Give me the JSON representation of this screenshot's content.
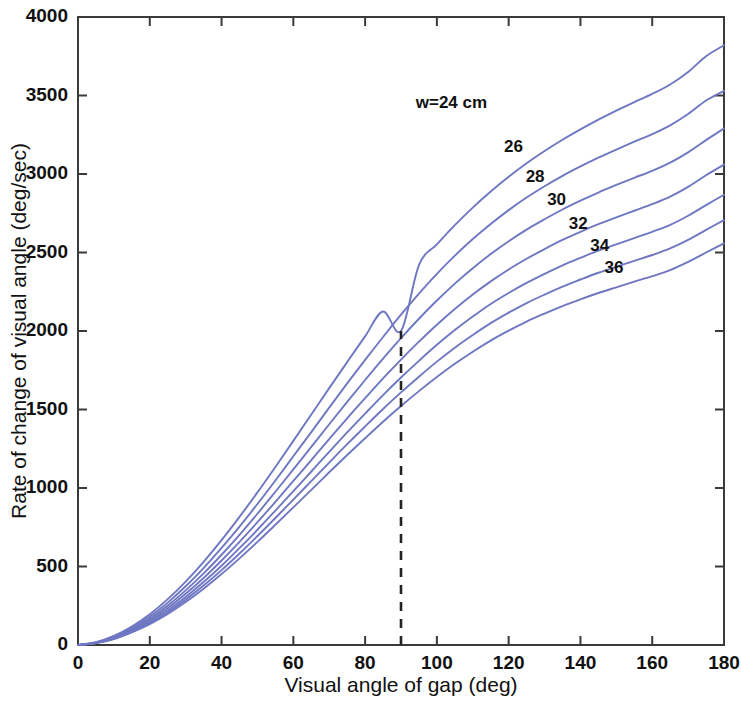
{
  "chart_data": {
    "type": "line",
    "title": "",
    "xlabel": "Visual angle of gap (deg)",
    "ylabel": "Rate of change of visual angle (deg/sec)",
    "xlim": [
      0,
      180
    ],
    "ylim": [
      0,
      4000
    ],
    "xticks": [
      0,
      20,
      40,
      60,
      80,
      100,
      120,
      140,
      160,
      180
    ],
    "yticks": [
      0,
      500,
      1000,
      1500,
      2000,
      2500,
      3000,
      3500,
      4000
    ],
    "grid": false,
    "legend_position": "inline-curve-labels",
    "series_color": "#6f77c2",
    "annotations": [
      {
        "name": "reference-line",
        "type": "vertical-dashed-line",
        "x": 90,
        "y_from": 0,
        "y_to": 2000,
        "color": "#232323"
      }
    ],
    "series": [
      {
        "name": "w=24 cm",
        "label": "w=24 cm",
        "w": 24,
        "x": [
          0,
          5,
          10,
          15,
          20,
          25,
          30,
          35,
          40,
          45,
          50,
          55,
          60,
          65,
          70,
          75,
          80,
          85,
          90,
          95,
          100,
          105,
          110,
          115,
          120,
          125,
          130,
          135,
          140,
          145,
          150,
          155,
          160,
          165,
          170,
          175,
          180
        ],
        "values": [
          0,
          18,
          58,
          118,
          196,
          292,
          404,
          530,
          668,
          816,
          972,
          1134,
          1300,
          1468,
          1636,
          1802,
          1966,
          2124,
          2000,
          2420,
          2552,
          2674,
          2786,
          2888,
          2982,
          3068,
          3146,
          3218,
          3284,
          3346,
          3404,
          3458,
          3510,
          3570,
          3650,
          3750,
          3820
        ]
      },
      {
        "name": "26",
        "label": "26",
        "w": 26,
        "x": [
          0,
          5,
          10,
          15,
          20,
          25,
          30,
          35,
          40,
          45,
          50,
          55,
          60,
          65,
          70,
          75,
          80,
          85,
          90,
          95,
          100,
          105,
          110,
          115,
          120,
          125,
          130,
          135,
          140,
          145,
          150,
          155,
          160,
          165,
          170,
          175,
          180
        ],
        "values": [
          0,
          16,
          53,
          109,
          181,
          270,
          374,
          490,
          618,
          754,
          898,
          1048,
          1202,
          1356,
          1512,
          1666,
          1816,
          1962,
          2104,
          2238,
          2364,
          2480,
          2586,
          2682,
          2770,
          2850,
          2922,
          2988,
          3048,
          3104,
          3156,
          3206,
          3254,
          3310,
          3382,
          3468,
          3530
        ]
      },
      {
        "name": "28",
        "label": "28",
        "w": 28,
        "x": [
          0,
          5,
          10,
          15,
          20,
          25,
          30,
          35,
          40,
          45,
          50,
          55,
          60,
          65,
          70,
          75,
          80,
          85,
          90,
          95,
          100,
          105,
          110,
          115,
          120,
          125,
          130,
          135,
          140,
          145,
          150,
          155,
          160,
          165,
          170,
          175,
          180
        ],
        "values": [
          0,
          15,
          49,
          101,
          168,
          251,
          348,
          456,
          575,
          702,
          836,
          976,
          1118,
          1262,
          1406,
          1548,
          1688,
          1824,
          1954,
          2078,
          2194,
          2302,
          2400,
          2490,
          2572,
          2646,
          2712,
          2774,
          2830,
          2882,
          2930,
          2976,
          3020,
          3072,
          3138,
          3216,
          3290
        ]
      },
      {
        "name": "30",
        "label": "30",
        "w": 30,
        "x": [
          0,
          5,
          10,
          15,
          20,
          25,
          30,
          35,
          40,
          45,
          50,
          55,
          60,
          65,
          70,
          75,
          80,
          85,
          90,
          95,
          100,
          105,
          110,
          115,
          120,
          125,
          130,
          135,
          140,
          145,
          150,
          155,
          160,
          165,
          170,
          175,
          180
        ],
        "values": [
          0,
          14,
          46,
          95,
          157,
          235,
          326,
          427,
          538,
          657,
          782,
          912,
          1045,
          1178,
          1312,
          1444,
          1572,
          1698,
          1818,
          1932,
          2040,
          2140,
          2232,
          2316,
          2392,
          2460,
          2522,
          2580,
          2632,
          2680,
          2724,
          2766,
          2808,
          2856,
          2918,
          2992,
          3060
        ]
      },
      {
        "name": "32",
        "label": "32",
        "w": 32,
        "x": [
          0,
          5,
          10,
          15,
          20,
          25,
          30,
          35,
          40,
          45,
          50,
          55,
          60,
          65,
          70,
          75,
          80,
          85,
          90,
          95,
          100,
          105,
          110,
          115,
          120,
          125,
          130,
          135,
          140,
          145,
          150,
          155,
          160,
          165,
          170,
          175,
          180
        ],
        "values": [
          0,
          13,
          43,
          89,
          148,
          221,
          306,
          401,
          505,
          617,
          734,
          856,
          980,
          1105,
          1230,
          1354,
          1474,
          1592,
          1704,
          1810,
          1912,
          2006,
          2092,
          2172,
          2242,
          2306,
          2364,
          2418,
          2466,
          2512,
          2552,
          2592,
          2632,
          2676,
          2734,
          2802,
          2868
        ]
      },
      {
        "name": "34",
        "label": "34",
        "w": 34,
        "x": [
          0,
          5,
          10,
          15,
          20,
          25,
          30,
          35,
          40,
          45,
          50,
          55,
          60,
          65,
          70,
          75,
          80,
          85,
          90,
          95,
          100,
          105,
          110,
          115,
          120,
          125,
          130,
          135,
          140,
          145,
          150,
          155,
          160,
          165,
          170,
          175,
          180
        ],
        "values": [
          0,
          12,
          40,
          84,
          140,
          209,
          289,
          379,
          477,
          583,
          694,
          809,
          926,
          1044,
          1162,
          1279,
          1392,
          1503,
          1609,
          1709,
          1805,
          1894,
          1975,
          2050,
          2117,
          2178,
          2232,
          2283,
          2328,
          2371,
          2409,
          2447,
          2484,
          2526,
          2580,
          2644,
          2706
        ]
      },
      {
        "name": "36",
        "label": "36",
        "w": 36,
        "x": [
          0,
          5,
          10,
          15,
          20,
          25,
          30,
          35,
          40,
          45,
          50,
          55,
          60,
          65,
          70,
          75,
          80,
          85,
          90,
          95,
          100,
          105,
          110,
          115,
          120,
          125,
          130,
          135,
          140,
          145,
          150,
          155,
          160,
          165,
          170,
          175,
          180
        ],
        "values": [
          0,
          12,
          38,
          80,
          133,
          198,
          274,
          359,
          452,
          552,
          657,
          766,
          877,
          988,
          1100,
          1210,
          1317,
          1422,
          1522,
          1617,
          1707,
          1791,
          1868,
          1939,
          2002,
          2060,
          2111,
          2159,
          2202,
          2242,
          2278,
          2314,
          2349,
          2388,
          2440,
          2500,
          2558
        ]
      }
    ],
    "curve_labels": [
      {
        "text": "w=24 cm",
        "x": 114,
        "y": 3450
      },
      {
        "text": "26",
        "x": 124,
        "y": 3170
      },
      {
        "text": "28",
        "x": 130,
        "y": 2980
      },
      {
        "text": "30",
        "x": 136,
        "y": 2830
      },
      {
        "text": "32",
        "x": 142,
        "y": 2680
      },
      {
        "text": "34",
        "x": 148,
        "y": 2540
      },
      {
        "text": "36",
        "x": 152,
        "y": 2400
      }
    ]
  }
}
